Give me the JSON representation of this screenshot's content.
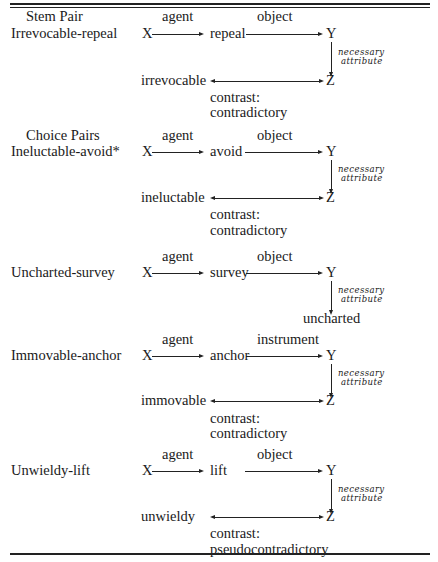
{
  "table": {
    "blocks": [
      {
        "heading": "Stem Pair",
        "pair": "Irrevocable-repeal",
        "x": "X",
        "verb": "repeal",
        "y": "Y",
        "z": "Z",
        "rel1": "agent",
        "rel2": "object",
        "attr1": "necessary",
        "attr2": "attribute",
        "adj": "irrevocable",
        "contrast_label": "contrast:",
        "contrast_type": "contradictory"
      },
      {
        "heading": "Choice Pairs",
        "pair": "Ineluctable-avoid*",
        "x": "X",
        "verb": "avoid",
        "y": "Y",
        "z": "Z",
        "rel1": "agent",
        "rel2": "object",
        "attr1": "necessary",
        "attr2": "attribute",
        "adj": "ineluctable",
        "contrast_label": "contrast:",
        "contrast_type": "contradictory"
      },
      {
        "pair": "Uncharted-survey",
        "x": "X",
        "verb": "survey",
        "y": "Y",
        "rel1": "agent",
        "rel2": "object",
        "attr1": "necessary",
        "attr2": "attribute",
        "adj": "uncharted"
      },
      {
        "pair": "Immovable-anchor",
        "x": "X",
        "verb": "anchor",
        "y": "Y",
        "z": "Z",
        "rel1": "agent",
        "rel2": "instrument",
        "attr1": "necessary",
        "attr2": "attribute",
        "adj": "immovable",
        "contrast_label": "contrast:",
        "contrast_type": "contradictory"
      },
      {
        "pair": "Unwieldy-lift",
        "x": "X",
        "verb": "lift",
        "y": "Y",
        "z": "Z",
        "rel1": "agent",
        "rel2": "object",
        "attr1": "necessary",
        "attr2": "attribute",
        "adj": "unwieldy",
        "contrast_label": "contrast:",
        "contrast_type": "pseudocontradictory"
      }
    ]
  }
}
